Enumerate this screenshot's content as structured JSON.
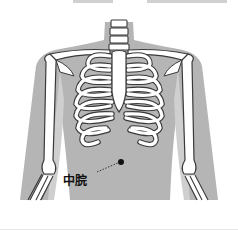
{
  "figure": {
    "acupoint": {
      "label": "中脘",
      "marker_x": 121,
      "marker_y": 162
    },
    "colors": {
      "body": "#b5b5b5",
      "bone": "#ffffff",
      "outline": "#3a3a3a",
      "marker": "#111111",
      "background": "#ffffff"
    }
  }
}
